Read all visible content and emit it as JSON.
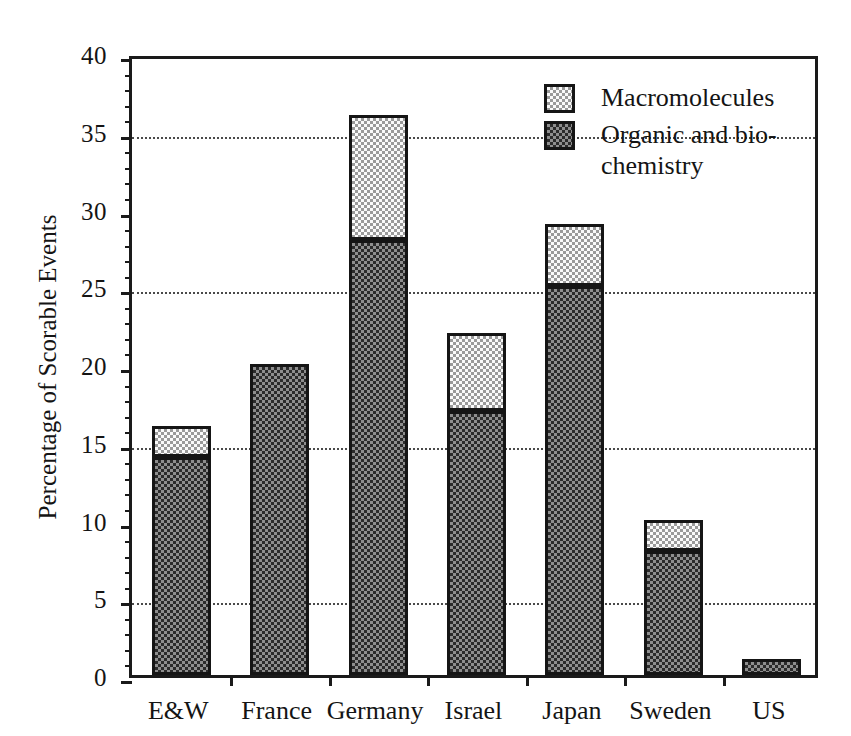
{
  "chart_data": {
    "type": "bar",
    "subtype": "stacked-bar",
    "title": "",
    "xlabel": "",
    "ylabel": "Percentage of Scorable Events",
    "categories": [
      "E&W",
      "France",
      "Germany",
      "Israel",
      "Japan",
      "Sweden",
      "US"
    ],
    "series": [
      {
        "name": "Organic and bio-chemistry",
        "legend_label_lines": [
          "Organic and bio-",
          "chemistry"
        ],
        "fill": "dark-checker",
        "color": "#8e8e8e",
        "values": [
          14,
          20,
          28,
          17,
          25,
          8,
          1
        ]
      },
      {
        "name": "Macromolecules",
        "legend_label_lines": [
          "Macromolecules"
        ],
        "fill": "light-checker",
        "color": "#fafafa",
        "values": [
          2,
          0,
          8,
          5,
          4,
          2,
          0
        ]
      }
    ],
    "totals": [
      16,
      20,
      36,
      22,
      29,
      10,
      1
    ],
    "ylim": [
      0,
      40
    ],
    "ytick_major": [
      0,
      5,
      10,
      15,
      20,
      25,
      30,
      35,
      40
    ],
    "ytick_labels": [
      "0",
      "5",
      "10",
      "15",
      "20",
      "25",
      "30",
      "35",
      "40"
    ],
    "ytick_minor_step": 1,
    "gridlines": [
      5,
      15,
      25,
      35
    ],
    "grid": "horizontal-dotted",
    "legend_position": "top-right",
    "legend_order": [
      "Macromolecules",
      "Organic and bio-chemistry"
    ]
  },
  "axes": {
    "y": {
      "title": "Percentage of Scorable Events",
      "ticks": [
        {
          "value": 40,
          "label": "40"
        },
        {
          "value": 35,
          "label": "35"
        },
        {
          "value": 30,
          "label": "30"
        },
        {
          "value": 25,
          "label": "25"
        },
        {
          "value": 20,
          "label": "20"
        },
        {
          "value": 15,
          "label": "15"
        },
        {
          "value": 10,
          "label": "10"
        },
        {
          "value": 5,
          "label": "5"
        },
        {
          "value": 0,
          "label": "0"
        }
      ]
    },
    "x": {
      "title": "",
      "ticks": [
        {
          "label": "E&W"
        },
        {
          "label": "France"
        },
        {
          "label": "Germany"
        },
        {
          "label": "Israel"
        },
        {
          "label": "Japan"
        },
        {
          "label": "Sweden"
        },
        {
          "label": "US"
        }
      ]
    }
  },
  "legend": {
    "items": [
      {
        "label": "Macromolecules",
        "label2": "",
        "swatch": "light-checker"
      },
      {
        "label": "Organic and bio-",
        "label2": "chemistry",
        "swatch": "dark-checker"
      }
    ]
  },
  "colors": {
    "axis": "#1a1a1a",
    "grid": "#4a4a4a",
    "text": "#141414",
    "series_dark": "#8e8e8e",
    "series_light": "#fafafa",
    "background": "#ffffff"
  }
}
